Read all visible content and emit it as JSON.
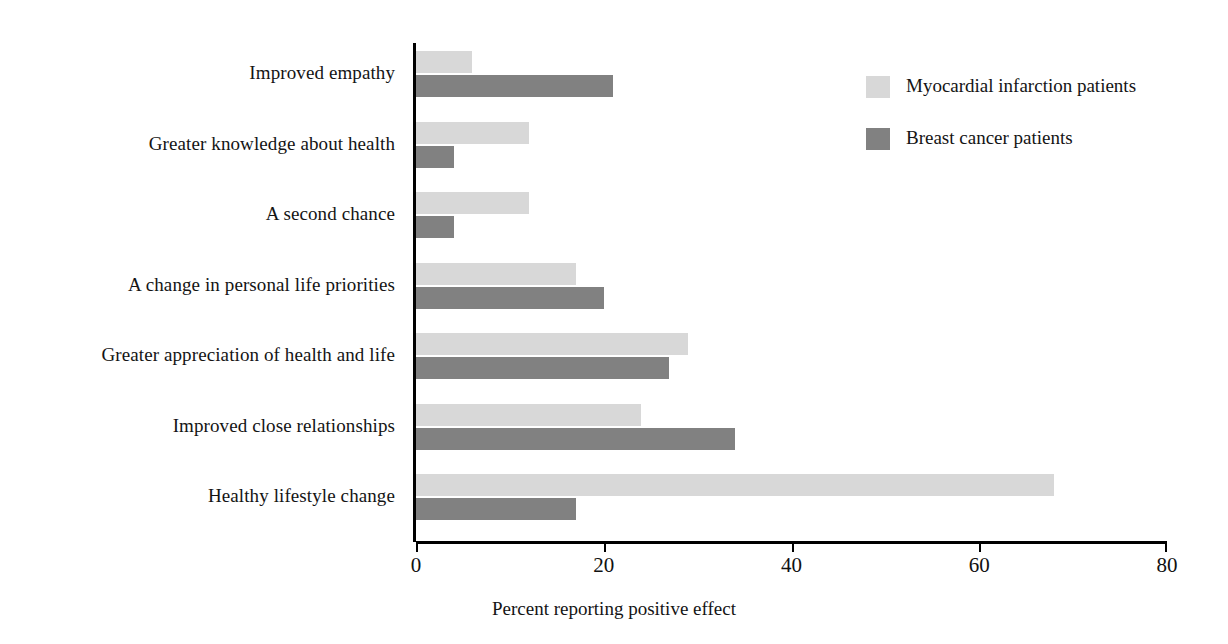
{
  "chart_data": {
    "type": "bar",
    "orientation": "horizontal",
    "title": "",
    "xlabel": "Percent reporting positive effect",
    "ylabel": "",
    "xlim": [
      0,
      80
    ],
    "xticks": [
      0,
      20,
      40,
      60,
      80
    ],
    "xtick_labels": [
      "0",
      "20",
      "40",
      "60",
      "80"
    ],
    "grid": false,
    "legend_position": "top-right",
    "categories": [
      "Improved empathy",
      "Greater knowledge about health",
      "A second chance",
      "A change in personal life priorities",
      "Greater appreciation of health and life",
      "Improved close relationships",
      "Healthy lifestyle change"
    ],
    "series": [
      {
        "name": "Myocardial infarction patients",
        "color": "#d8d8d8",
        "values": [
          6,
          12,
          12,
          17,
          29,
          24,
          68
        ]
      },
      {
        "name": "Breast cancer patients",
        "color": "#818181",
        "values": [
          21,
          4,
          4,
          20,
          27,
          34,
          17
        ]
      }
    ]
  },
  "legend": {
    "items": [
      {
        "label": "Myocardial infarction patients",
        "swatch": "series-a"
      },
      {
        "label": "Breast cancer patients",
        "swatch": "series-b"
      }
    ]
  }
}
